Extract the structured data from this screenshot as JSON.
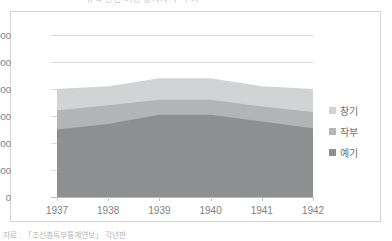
{
  "title": "유곽 관련 여성 종사자 수 추이",
  "source_caption": "자료 : 「조선총독부통계연보」 각년판",
  "colors": {
    "series_light": "#d2d3d4",
    "series_medium": "#b3b4b6",
    "series_dark": "#8d8f91",
    "gridline": "#d9dbde",
    "axis": "#b9bbbe",
    "frame_border": "#d3d5d8",
    "tick_text": "#808285",
    "legend_text": "#6f7174",
    "plot_background": "#ffffff"
  },
  "legend": {
    "position": "right",
    "items": [
      {
        "label": "창기",
        "color": "#d2d3d4",
        "swatch_icon": "square-swatch-icon"
      },
      {
        "label": "작부",
        "color": "#b3b4b6",
        "swatch_icon": "square-swatch-icon"
      },
      {
        "label": "예기",
        "color": "#8d8f91",
        "swatch_icon": "square-swatch-icon"
      }
    ]
  },
  "axes": {
    "y_ticks": [
      "0",
      "2000",
      "4000",
      "6000",
      "8000",
      "10000",
      "12000"
    ],
    "x_ticks": [
      "1937",
      "1938",
      "1939",
      "1940",
      "1941",
      "1942"
    ]
  },
  "chart_data": {
    "type": "area",
    "stacked": true,
    "title": "유곽 관련 여성 종사자 수 추이",
    "xlabel": "",
    "ylabel": "",
    "x": [
      1937,
      1938,
      1939,
      1940,
      1941,
      1942
    ],
    "categories": [
      "1937",
      "1938",
      "1939",
      "1940",
      "1941",
      "1942"
    ],
    "series": [
      {
        "name": "예기",
        "color": "#8d8f91",
        "values": [
          5000,
          5400,
          6100,
          6100,
          5600,
          5100
        ]
      },
      {
        "name": "작부",
        "color": "#b3b4b6",
        "values": [
          1400,
          1400,
          1100,
          1100,
          1100,
          1200
        ]
      },
      {
        "name": "창기",
        "color": "#d2d3d4",
        "values": [
          1600,
          1400,
          1600,
          1600,
          1500,
          1700
        ]
      }
    ],
    "cumulative_totals": [
      8000,
      8200,
      8800,
      8800,
      8200,
      8000
    ],
    "ylim": [
      0,
      12000
    ],
    "ytick_step": 2000,
    "grid": true,
    "legend_position": "right"
  }
}
